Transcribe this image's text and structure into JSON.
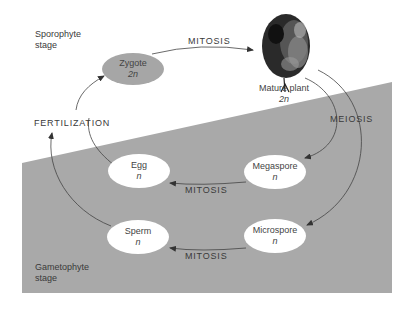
{
  "diagram": {
    "colors": {
      "background": "#ffffff",
      "gametophyte_region": "#a9a9a9",
      "zygote_fill": "#a6a6a6",
      "haploid_fill": "#ffffff",
      "line": "#444444"
    },
    "regions": {
      "sporophyte": {
        "line1": "Sporophyte",
        "line2": "stage"
      },
      "gametophyte": {
        "line1": "Gametophyte",
        "line2": "stage"
      }
    },
    "nodes": {
      "zygote": {
        "name": "Zygote",
        "ploidy": "2n"
      },
      "mature_plant": {
        "name": "Mature plant",
        "ploidy": "2n",
        "icon": "tree-icon"
      },
      "megaspore": {
        "name": "Megaspore",
        "ploidy": "n"
      },
      "microspore": {
        "name": "Microspore",
        "ploidy": "n"
      },
      "egg": {
        "name": "Egg",
        "ploidy": "n"
      },
      "sperm": {
        "name": "Sperm",
        "ploidy": "n"
      }
    },
    "processes": {
      "zygote_to_plant": "MITOSIS",
      "plant_to_spores": "MEIOSIS",
      "megaspore_to_egg": "MITOSIS",
      "microspore_to_sperm": "MITOSIS",
      "gametes_to_zygote": "FERTILIZATION"
    },
    "edges": [
      {
        "from": "Zygote",
        "to": "Mature plant",
        "label": "MITOSIS"
      },
      {
        "from": "Mature plant",
        "to": "Megaspore",
        "label": "MEIOSIS"
      },
      {
        "from": "Mature plant",
        "to": "Microspore",
        "label": "MEIOSIS"
      },
      {
        "from": "Megaspore",
        "to": "Egg",
        "label": "MITOSIS"
      },
      {
        "from": "Microspore",
        "to": "Sperm",
        "label": "MITOSIS"
      },
      {
        "from": "Egg",
        "to": "Zygote",
        "label": "FERTILIZATION"
      },
      {
        "from": "Sperm",
        "to": "Zygote",
        "label": "FERTILIZATION"
      }
    ]
  }
}
